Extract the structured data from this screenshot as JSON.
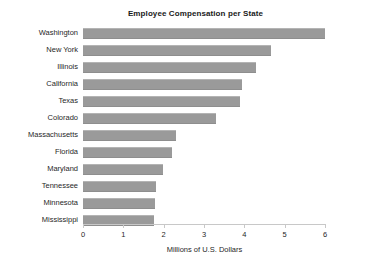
{
  "chart_data": {
    "type": "bar",
    "orientation": "horizontal",
    "title": "Employee Compensation per State",
    "xlabel": "Millions of U.S. Dollars",
    "ylabel": "",
    "categories": [
      "Washington",
      "New York",
      "Illinois",
      "California",
      "Texas",
      "Colorado",
      "Massachusetts",
      "Florida",
      "Maryland",
      "Tennessee",
      "Minnesota",
      "Mississippi"
    ],
    "values": [
      6.0,
      4.65,
      4.3,
      3.95,
      3.9,
      3.3,
      2.3,
      2.2,
      1.98,
      1.8,
      1.78,
      1.77
    ],
    "xlim": [
      0,
      6
    ],
    "xticks": [
      0,
      1,
      2,
      3,
      4,
      5,
      6
    ],
    "xtick_labels": [
      "0",
      "1",
      "2",
      "3",
      "4",
      "5",
      "6"
    ],
    "grid": false,
    "legend": false,
    "bar_color": "#9a9a9a",
    "axis_color": "#c8c8c8",
    "text_color": "#1f1f1f",
    "background": "#ffffff"
  }
}
